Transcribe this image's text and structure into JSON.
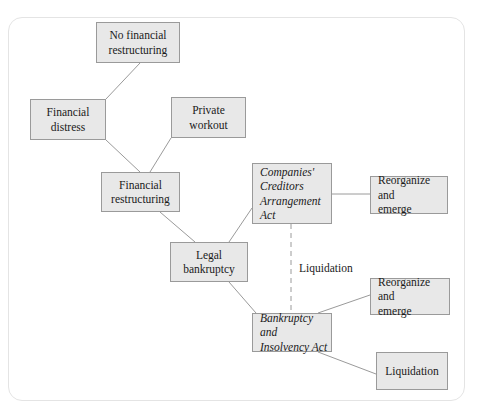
{
  "figure": {
    "type": "flowchart",
    "title": "",
    "frame": {
      "border_color": "#e4e4e4",
      "rounded": true
    },
    "style": {
      "node_fill": "#e8e8e8",
      "node_border": "#9a9a9a",
      "connector_color": "#9a9a9a",
      "text_color": "#1a1a1a"
    }
  },
  "nodes": [
    {
      "id": "no-financial-restructuring",
      "label": "No financial\nrestructuring",
      "align": "center",
      "italic": false,
      "x": 96,
      "y": 22,
      "w": 84,
      "h": 41
    },
    {
      "id": "financial-distress",
      "label": "Financial\ndistress",
      "align": "center",
      "italic": false,
      "x": 30,
      "y": 99,
      "w": 76,
      "h": 41
    },
    {
      "id": "private-workout",
      "label": "Private\nworkout",
      "align": "center",
      "italic": false,
      "x": 171,
      "y": 97,
      "w": 75,
      "h": 41
    },
    {
      "id": "financial-restructuring",
      "label": "Financial\nrestructuring",
      "align": "center",
      "italic": false,
      "x": 101,
      "y": 172,
      "w": 79,
      "h": 40
    },
    {
      "id": "legal-bankruptcy",
      "label": "Legal\nbankruptcy",
      "align": "center",
      "italic": false,
      "x": 170,
      "y": 242,
      "w": 78,
      "h": 40
    },
    {
      "id": "companies-creditors-arrangement-act",
      "label": "Companies'\nCreditors\nArrangement\nAct",
      "align": "left",
      "italic": true,
      "x": 252,
      "y": 163,
      "w": 80,
      "h": 61
    },
    {
      "id": "ccaa-reorganize-and-emerge",
      "label": "Reorganize and\nemerge",
      "align": "left",
      "italic": false,
      "x": 370,
      "y": 176,
      "w": 78,
      "h": 38
    },
    {
      "id": "bankruptcy-and-insolvency-act",
      "label": "Bankruptcy and\nInsolvency Act",
      "align": "left",
      "italic": true,
      "x": 252,
      "y": 313,
      "w": 80,
      "h": 39
    },
    {
      "id": "bia-reorganize-and-emerge",
      "label": "Reorganize and\nemerge",
      "align": "left",
      "italic": false,
      "x": 370,
      "y": 278,
      "w": 80,
      "h": 37
    },
    {
      "id": "bia-liquidation",
      "label": "Liquidation",
      "align": "center",
      "italic": false,
      "x": 376,
      "y": 352,
      "w": 72,
      "h": 38
    }
  ],
  "edge_labels": [
    {
      "id": "liquidation-label",
      "text": "Liquidation",
      "x": 299,
      "y": 261
    }
  ],
  "connectors": [
    {
      "id": "distress-to-no-restructuring",
      "from": "financial-distress",
      "to": "no-financial-restructuring",
      "style": "solid",
      "x1": 106,
      "y1": 99,
      "x2": 140,
      "y2": 63
    },
    {
      "id": "distress-to-restructuring",
      "from": "financial-distress",
      "to": "financial-restructuring",
      "style": "solid",
      "x1": 106,
      "y1": 140,
      "x2": 140,
      "y2": 172
    },
    {
      "id": "workout-to-restructuring",
      "from": "private-workout",
      "to": "financial-restructuring",
      "style": "solid",
      "x1": 171,
      "y1": 138,
      "x2": 150,
      "y2": 172
    },
    {
      "id": "restructuring-to-legal-bankruptcy",
      "from": "financial-restructuring",
      "to": "legal-bankruptcy",
      "style": "solid",
      "x1": 160,
      "y1": 212,
      "x2": 195,
      "y2": 242
    },
    {
      "id": "legal-bankruptcy-to-ccaa",
      "from": "legal-bankruptcy",
      "to": "companies-creditors-arrangement-act",
      "style": "solid",
      "x1": 229,
      "y1": 242,
      "x2": 252,
      "y2": 208
    },
    {
      "id": "legal-bankruptcy-to-bia",
      "from": "legal-bankruptcy",
      "to": "bankruptcy-and-insolvency-act",
      "style": "solid",
      "x1": 229,
      "y1": 282,
      "x2": 256,
      "y2": 313
    },
    {
      "id": "ccaa-to-reorganize",
      "from": "companies-creditors-arrangement-act",
      "to": "ccaa-reorganize-and-emerge",
      "style": "solid",
      "x1": 332,
      "y1": 194,
      "x2": 370,
      "y2": 194
    },
    {
      "id": "ccaa-to-bia-liquidation",
      "from": "companies-creditors-arrangement-act",
      "to": "bankruptcy-and-insolvency-act",
      "style": "dashed",
      "x1": 291,
      "y1": 224,
      "x2": 291,
      "y2": 313
    },
    {
      "id": "bia-to-reorganize",
      "from": "bankruptcy-and-insolvency-act",
      "to": "bia-reorganize-and-emerge",
      "style": "solid",
      "x1": 318,
      "y1": 313,
      "x2": 370,
      "y2": 295
    },
    {
      "id": "bia-to-liquidation",
      "from": "bankruptcy-and-insolvency-act",
      "to": "bia-liquidation",
      "style": "solid",
      "x1": 318,
      "y1": 352,
      "x2": 376,
      "y2": 374
    }
  ]
}
